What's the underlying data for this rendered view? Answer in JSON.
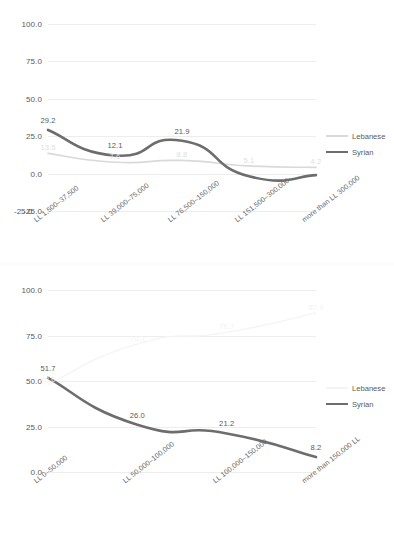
{
  "charts": [
    {
      "id": "chart-1",
      "legend": {
        "position": "right",
        "items": [
          {
            "name": "Lebanese",
            "color": "#d9d9d9"
          },
          {
            "name": "Syrian",
            "color": "#6d6d6d"
          }
        ]
      },
      "chart_data": {
        "type": "line",
        "title": "",
        "xlabel": "",
        "ylabel": "",
        "ylim": [
          -25.0,
          100.0
        ],
        "yticks": [
          "100.0",
          "75.0",
          "50.0",
          "25.0",
          "0.0",
          "-25.0"
        ],
        "grid": true,
        "categories": [
          "LL 1,500–37,500",
          "LL 39,000–75,000",
          "LL 76,500–150,000",
          "LL 151,500–300,000",
          "more than LL 300,000"
        ],
        "series": [
          {
            "name": "Lebanese",
            "color": "#d9d9d9",
            "values": [
              13.5,
              7.6,
              8.8,
              5.1,
              4.2
            ],
            "labels": [
              "13.5",
              "7.6",
              "8.8",
              "5.1",
              "4.2"
            ]
          },
          {
            "name": "Syrian",
            "color": "#6d6d6d",
            "values": [
              29.2,
              12.1,
              21.9,
              -1.8,
              -1.0
            ],
            "labels": [
              "29.2",
              "12.1",
              "21.9",
              "",
              ""
            ]
          }
        ]
      }
    },
    {
      "id": "chart-2",
      "legend": {
        "position": "right",
        "items": [
          {
            "name": "Lebanese",
            "color": "#f4f4f4"
          },
          {
            "name": "Syrian",
            "color": "#6d6d6d"
          }
        ]
      },
      "chart_data": {
        "type": "line",
        "title": "",
        "xlabel": "",
        "ylabel": "",
        "ylim": [
          0.0,
          100.0
        ],
        "yticks": [
          "100.0",
          "75.0",
          "50.0",
          "25.0",
          "0.0"
        ],
        "grid": true,
        "categories": [
          "LL 0–50,000",
          "LL 50,000–100,000",
          "LL 100,000–150,000",
          "more than 150,000 LL"
        ],
        "series": [
          {
            "name": "Lebanese",
            "color": "#f4f4f4",
            "values": [
              48.0,
              70.3,
              76.7,
              87.4
            ],
            "labels": [
              "48.0",
              "70.3",
              "76.7",
              "87.4"
            ]
          },
          {
            "name": "Syrian",
            "color": "#6d6d6d",
            "values": [
              51.7,
              26.0,
              21.2,
              8.2
            ],
            "labels": [
              "51.7",
              "26.0",
              "21.2",
              "8.2"
            ]
          }
        ]
      }
    }
  ]
}
